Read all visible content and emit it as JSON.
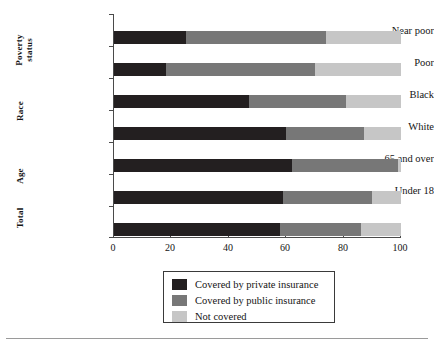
{
  "chart_data": {
    "type": "bar",
    "orientation": "horizontal",
    "stacked": true,
    "title": "",
    "subtitle": "",
    "xlabel": "",
    "ylabel": "",
    "xlim": [
      0,
      100
    ],
    "xticks": [
      0,
      20,
      40,
      60,
      80,
      100
    ],
    "xticklabels": [
      "0",
      "20",
      "40",
      "60",
      "80",
      "100"
    ],
    "grid": false,
    "legend_position": "below-center",
    "categories": [
      "Total",
      "Under 18",
      "65 and over",
      "White",
      "Black",
      "Poor",
      "Near poor"
    ],
    "category_groups": [
      {
        "label_line1": "Poverty",
        "label_line2": "status",
        "members": [
          "Near poor",
          "Poor"
        ]
      },
      {
        "label_line1": "Race",
        "label_line2": "",
        "members": [
          "Black",
          "White"
        ]
      },
      {
        "label_line1": "Age",
        "label_line2": "",
        "members": [
          "65 and over",
          "Under 18"
        ]
      },
      {
        "label_line1": "Total",
        "label_line2": "",
        "members": [
          "Total"
        ]
      }
    ],
    "series": [
      {
        "name": "Covered by private insurance",
        "color": "#231f20",
        "values": [
          58,
          59,
          62,
          60,
          47,
          18,
          25
        ]
      },
      {
        "name": "Covered by public insurance",
        "color": "#777777",
        "values": [
          28,
          31,
          37,
          27,
          34,
          52,
          49
        ]
      },
      {
        "name": "Not covered",
        "color": "#c6c6c6",
        "values": [
          14,
          10,
          1,
          13,
          19,
          30,
          26
        ]
      }
    ]
  },
  "legend": {
    "items": [
      {
        "label": "Covered by private insurance",
        "color": "#231f20"
      },
      {
        "label": "Covered by public insurance",
        "color": "#777777"
      },
      {
        "label": "Not covered",
        "color": "#c6c6c6"
      }
    ]
  }
}
